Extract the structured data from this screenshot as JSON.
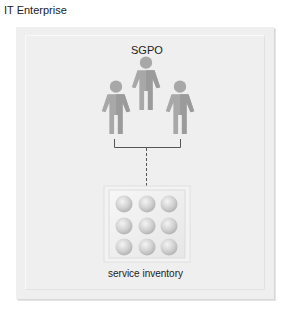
{
  "title": "IT Enterprise",
  "group": {
    "label": "SGPO",
    "members": [
      {
        "name": "person-left",
        "cx": 116,
        "top": 80,
        "scale": 1.0
      },
      {
        "name": "person-center",
        "cx": 146,
        "top": 56,
        "scale": 1.0
      },
      {
        "name": "person-right",
        "cx": 180,
        "top": 80,
        "scale": 1.0
      }
    ]
  },
  "inventory": {
    "label": "service inventory",
    "rows": 3,
    "cols": 3
  },
  "colors": {
    "figure": "#a9a9a9",
    "figure_shade": "#989898",
    "connector": "#555555",
    "sphere_light": "#f2f2f2",
    "sphere_dark": "#b9b9b9"
  }
}
